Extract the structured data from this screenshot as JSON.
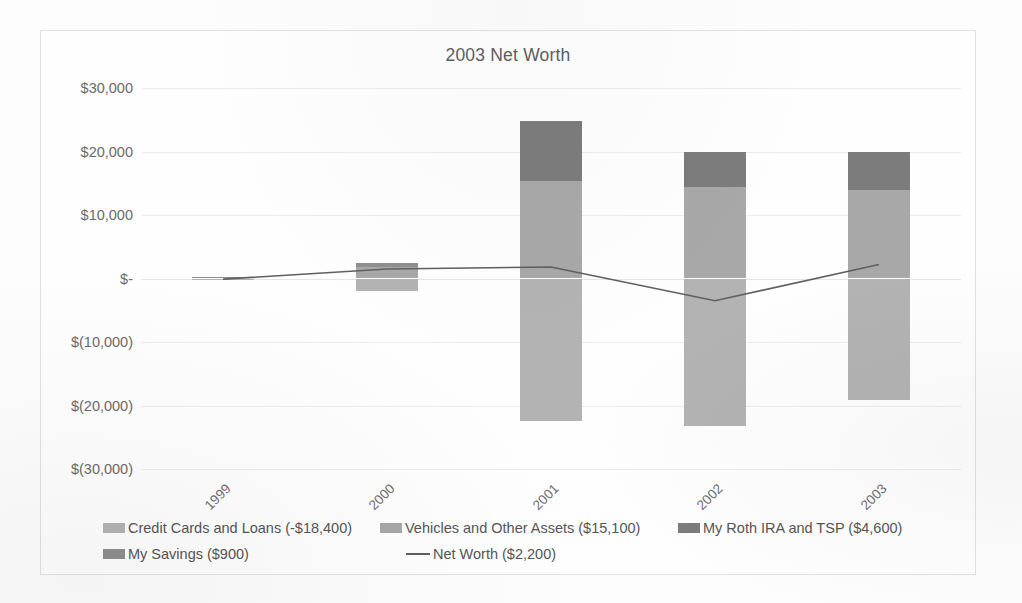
{
  "chart_data": {
    "type": "bar",
    "title": "2003 Net Worth",
    "xlabel": "",
    "ylabel": "",
    "categories": [
      "1999",
      "2000",
      "2001",
      "2002",
      "2003"
    ],
    "ylim": [
      -30000,
      30000
    ],
    "ytick_labels": [
      "$30,000",
      "$20,000",
      "$10,000",
      "$-",
      "$(10,000)",
      "$(20,000)",
      "$(30,000)"
    ],
    "ytick_values": [
      30000,
      20000,
      10000,
      0,
      -10000,
      -20000,
      -30000
    ],
    "grid": true,
    "legend_position": "bottom",
    "stacked": true,
    "series": [
      {
        "name": "Credit Cards and Loans (-$18,400)",
        "legend_value": "-18400",
        "color": "#b3b3b3",
        "values": [
          -300,
          -2000,
          -22500,
          -23300,
          -19200
        ]
      },
      {
        "name": "Vehicles and Other Assets ($15,100)",
        "legend_value": "15100",
        "color": "#a8a8a8",
        "values": [
          0,
          1800,
          15400,
          14400,
          14000
        ]
      },
      {
        "name": "My Roth IRA and TSP ($4,600)",
        "legend_value": "4600",
        "color": "#7c7c7c",
        "values": [
          0,
          0,
          9400,
          5600,
          6000
        ]
      },
      {
        "name": "My Savings ($900)",
        "legend_value": "900",
        "color": "#8f8f8f",
        "values": [
          200,
          700,
          0,
          0,
          0
        ]
      }
    ],
    "line_series": {
      "name": "Net Worth ($2,200)",
      "legend_value": "2200",
      "color": "#5f5f5f",
      "values": [
        -100,
        1500,
        1800,
        -3500,
        2200
      ]
    }
  },
  "legend": {
    "items": [
      {
        "label": "Credit Cards and Loans (-$18,400)",
        "type": "swatch",
        "color": "#b3b3b3"
      },
      {
        "label": "Vehicles and Other Assets ($15,100)",
        "type": "swatch",
        "color": "#a8a8a8"
      },
      {
        "label": "My Roth IRA and TSP ($4,600)",
        "type": "swatch",
        "color": "#7c7c7c"
      },
      {
        "label": "My Savings ($900)",
        "type": "swatch",
        "color": "#8f8f8f"
      },
      {
        "label": "Net Worth ($2,200)",
        "type": "line",
        "color": "#5f5f5f"
      }
    ]
  }
}
